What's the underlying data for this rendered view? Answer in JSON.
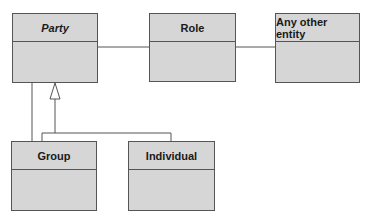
{
  "diagram": {
    "type": "uml-class-diagram",
    "classes": [
      {
        "id": "party",
        "name": "Party",
        "abstract": true
      },
      {
        "id": "role",
        "name": "Role",
        "abstract": false
      },
      {
        "id": "any_other_entity",
        "name": "Any other entity",
        "abstract": false
      },
      {
        "id": "group",
        "name": "Group",
        "abstract": false
      },
      {
        "id": "individual",
        "name": "Individual",
        "abstract": false
      }
    ],
    "relationships": [
      {
        "type": "association",
        "from": "Party",
        "to": "Role"
      },
      {
        "type": "association",
        "from": "Role",
        "to": "Any other entity"
      },
      {
        "type": "generalization",
        "from": "Group",
        "to": "Party"
      },
      {
        "type": "generalization",
        "from": "Individual",
        "to": "Party"
      },
      {
        "type": "association",
        "from": "Group",
        "to": "Party"
      }
    ],
    "colors": {
      "box_fill": "#d6d6d6",
      "line": "#555555",
      "text": "#1a1a1a"
    }
  }
}
